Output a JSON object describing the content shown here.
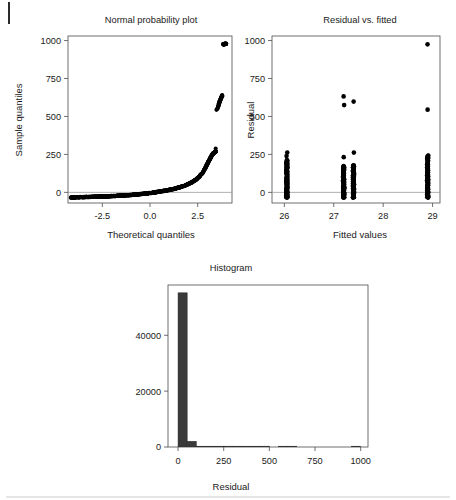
{
  "figure": {
    "title": "",
    "background": "#ffffff",
    "point_color": "#000000",
    "bar_color": "#3a3a3a",
    "axis_color": "#4d4d4d"
  },
  "panels": {
    "qq": {
      "title": "Normal probability plot",
      "xlabel": "Theoretical quantiles",
      "ylabel": "Sample quantiles",
      "xticks": [
        "-2.5",
        "0.0",
        "2.5"
      ],
      "yticks": [
        "0",
        "250",
        "500",
        "750",
        "1000"
      ]
    },
    "resid": {
      "title": "Residual vs. fitted",
      "xlabel": "Fitted values",
      "ylabel": "Residual",
      "xticks": [
        "26",
        "27",
        "28",
        "29"
      ],
      "yticks": [
        "0",
        "250",
        "500",
        "750",
        "1000"
      ]
    },
    "hist": {
      "title": "Histogram",
      "xlabel": "Residual",
      "ylabel": "",
      "xticks": [
        "0",
        "250",
        "500",
        "750",
        "1000"
      ],
      "yticks": [
        "0",
        "20000",
        "40000"
      ]
    }
  },
  "chart_data": [
    {
      "type": "scatter",
      "name": "normal-probability-plot",
      "title": "Normal probability plot",
      "xlabel": "Theoretical quantiles",
      "ylabel": "Sample quantiles",
      "xlim": [
        -4.3,
        4.3
      ],
      "ylim": [
        -70,
        1030
      ],
      "xticks": [
        -2.5,
        0.0,
        2.5
      ],
      "yticks": [
        0,
        250,
        500,
        750,
        1000
      ],
      "grid": false,
      "reference_line": {
        "y": 0,
        "color": "#9a9a9a"
      },
      "x": [
        -4.15,
        -4.0,
        -3.85,
        -3.7,
        -3.55,
        -3.4,
        -3.25,
        -3.1,
        -2.95,
        -2.8,
        -2.65,
        -2.5,
        -2.35,
        -2.2,
        -2.05,
        -1.9,
        -1.75,
        -1.6,
        -1.45,
        -1.3,
        -1.15,
        -1.0,
        -0.85,
        -0.7,
        -0.55,
        -0.4,
        -0.25,
        -0.1,
        0.05,
        0.2,
        0.35,
        0.5,
        0.65,
        0.8,
        0.95,
        1.1,
        1.25,
        1.4,
        1.55,
        1.7,
        1.85,
        2.0,
        2.15,
        2.3,
        2.45,
        2.6,
        2.75,
        2.9,
        3.0,
        3.1,
        3.2,
        3.3,
        3.4,
        3.45,
        3.5,
        3.55,
        3.6,
        3.62,
        3.64,
        3.66,
        3.68,
        3.7,
        3.72,
        3.74,
        3.76,
        3.78,
        3.8,
        3.85,
        3.9,
        3.95,
        4.0
      ],
      "y": [
        -33,
        -33,
        -32,
        -32,
        -31,
        -31,
        -30,
        -30,
        -29,
        -29,
        -28,
        -28,
        -27,
        -26,
        -25,
        -24,
        -23,
        -22,
        -21,
        -20,
        -19,
        -17,
        -16,
        -14,
        -12,
        -10,
        -8,
        -6,
        -4,
        -1,
        2,
        5,
        8,
        11,
        15,
        19,
        23,
        28,
        33,
        39,
        46,
        54,
        63,
        74,
        88,
        105,
        128,
        160,
        185,
        210,
        235,
        255,
        266,
        270,
        545,
        560,
        575,
        585,
        595,
        600,
        605,
        612,
        618,
        625,
        630,
        635,
        640,
        975,
        977,
        978,
        980
      ],
      "outlier_cluster_note": "Upper tail breaks away: a tight group near 545-640 and isolated points near 975-980"
    },
    {
      "type": "scatter",
      "name": "residual-vs-fitted",
      "title": "Residual vs. fitted",
      "xlabel": "Fitted values",
      "ylabel": "Residual",
      "xlim": [
        25.75,
        29.15
      ],
      "ylim": [
        -70,
        1030
      ],
      "xticks": [
        26,
        27,
        28,
        29
      ],
      "yticks": [
        0,
        250,
        500,
        750,
        1000
      ],
      "grid": false,
      "reference_line": {
        "y": 0,
        "color": "#9a9a9a"
      },
      "groups": [
        {
          "fitted": 26.05,
          "residual_range": [
            -35,
            215
          ],
          "density": "dense",
          "extra_points": [
            240,
            262
          ]
        },
        {
          "fitted": 27.2,
          "residual_range": [
            -35,
            175
          ],
          "density": "dense",
          "extra_points": [
            232,
            575,
            632
          ]
        },
        {
          "fitted": 27.4,
          "residual_range": [
            -35,
            180
          ],
          "density": "dense",
          "extra_points": [
            262,
            598
          ]
        },
        {
          "fitted": 28.9,
          "residual_range": [
            -35,
            245
          ],
          "density": "dense",
          "extra_points": [
            545,
            975
          ]
        }
      ]
    },
    {
      "type": "bar",
      "name": "histogram-of-residuals",
      "title": "Histogram",
      "xlabel": "Residual",
      "ylabel": "",
      "xlim": [
        -55,
        1040
      ],
      "ylim": [
        0,
        58000
      ],
      "xticks": [
        0,
        250,
        500,
        750,
        1000
      ],
      "yticks": [
        0,
        20000,
        40000
      ],
      "grid": false,
      "bin_width": 50,
      "bin_starts": [
        -50,
        0,
        50,
        100,
        150,
        200,
        250,
        300,
        350,
        400,
        450,
        500,
        550,
        600,
        650,
        700,
        750,
        800,
        850,
        900,
        950,
        1000
      ],
      "values": [
        0,
        55200,
        2050,
        120,
        30,
        12,
        6,
        3,
        2,
        1,
        1,
        0,
        1,
        1,
        0,
        0,
        0,
        0,
        0,
        0,
        1,
        0
      ],
      "categories": [
        "-50",
        "0",
        "50",
        "100",
        "150",
        "200",
        "250",
        "300",
        "350",
        "400",
        "450",
        "500",
        "550",
        "600",
        "650",
        "700",
        "750",
        "800",
        "850",
        "900",
        "950",
        "1000"
      ]
    }
  ]
}
